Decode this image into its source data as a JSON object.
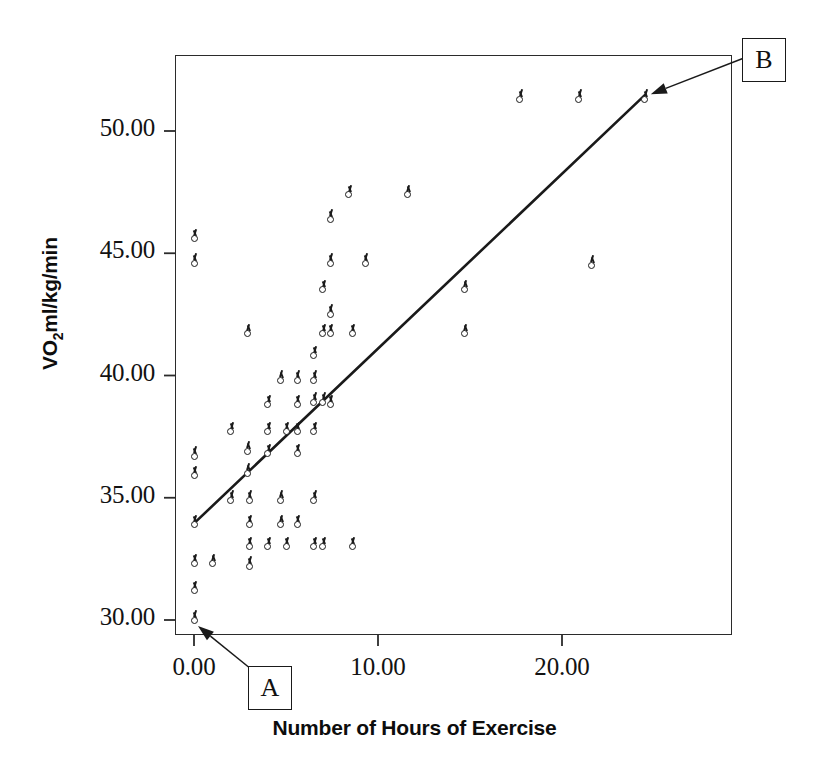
{
  "chart_data": {
    "type": "scatter",
    "title": "",
    "xlabel": "Number of Hours of Exercise",
    "ylabel": "VO2ml/kg/min",
    "ylabel_parts": {
      "pre": "VO",
      "sub": "2",
      "post": "ml/kg/min"
    },
    "xlim": [
      -0.9,
      29.8
    ],
    "ylim": [
      28.9,
      52.6
    ],
    "xticks": [
      0,
      10,
      20
    ],
    "xticklabels": [
      "0.00",
      "10.00",
      "20.00"
    ],
    "yticks": [
      30,
      35,
      40,
      45,
      50
    ],
    "yticklabels": [
      "30.00",
      "35.00",
      "40.00",
      "45.00",
      "50.00"
    ],
    "grid": false,
    "legend": false,
    "marker": "circle-with-tick",
    "marker_color": "#1b1b1b",
    "fit_line": {
      "type": "linear-regression",
      "intercept": 33.95,
      "slope": 0.715,
      "x_start": 0.0,
      "x_end": 24.5,
      "color": "#1a1a1a",
      "width": 2.6
    },
    "annotations": [
      {
        "label": "A",
        "target_point": {
          "x": 0.0,
          "y": 30.0
        },
        "description": "callout pointing to lowest-left data point"
      },
      {
        "label": "B",
        "target_point": {
          "x": 24.5,
          "y": 51.3
        },
        "description": "callout pointing to highest-right data point"
      }
    ],
    "points": [
      {
        "x": 0.0,
        "y": 45.6
      },
      {
        "x": 0.0,
        "y": 44.6
      },
      {
        "x": 0.0,
        "y": 36.7
      },
      {
        "x": 0.0,
        "y": 35.9
      },
      {
        "x": 0.0,
        "y": 33.9
      },
      {
        "x": 0.0,
        "y": 32.3
      },
      {
        "x": 0.0,
        "y": 31.2
      },
      {
        "x": 0.0,
        "y": 30.0
      },
      {
        "x": 1.0,
        "y": 32.3
      },
      {
        "x": 2.0,
        "y": 37.7
      },
      {
        "x": 2.0,
        "y": 34.9
      },
      {
        "x": 2.9,
        "y": 41.7
      },
      {
        "x": 2.9,
        "y": 36.9
      },
      {
        "x": 2.9,
        "y": 36.0
      },
      {
        "x": 3.0,
        "y": 34.9
      },
      {
        "x": 3.0,
        "y": 33.9
      },
      {
        "x": 3.0,
        "y": 33.0
      },
      {
        "x": 3.0,
        "y": 32.2
      },
      {
        "x": 4.0,
        "y": 38.8
      },
      {
        "x": 4.0,
        "y": 37.7
      },
      {
        "x": 4.0,
        "y": 36.8
      },
      {
        "x": 4.0,
        "y": 33.0
      },
      {
        "x": 4.7,
        "y": 39.8
      },
      {
        "x": 4.7,
        "y": 34.9
      },
      {
        "x": 4.7,
        "y": 33.9
      },
      {
        "x": 5.0,
        "y": 37.7
      },
      {
        "x": 5.0,
        "y": 33.0
      },
      {
        "x": 5.6,
        "y": 39.8
      },
      {
        "x": 5.6,
        "y": 38.8
      },
      {
        "x": 5.6,
        "y": 37.7
      },
      {
        "x": 5.6,
        "y": 36.8
      },
      {
        "x": 5.6,
        "y": 33.9
      },
      {
        "x": 6.5,
        "y": 40.8
      },
      {
        "x": 6.5,
        "y": 39.8
      },
      {
        "x": 6.5,
        "y": 38.9
      },
      {
        "x": 6.5,
        "y": 37.7
      },
      {
        "x": 6.5,
        "y": 34.9
      },
      {
        "x": 6.5,
        "y": 33.0
      },
      {
        "x": 7.0,
        "y": 43.5
      },
      {
        "x": 7.0,
        "y": 41.7
      },
      {
        "x": 7.0,
        "y": 38.9
      },
      {
        "x": 7.0,
        "y": 33.0
      },
      {
        "x": 7.4,
        "y": 46.4
      },
      {
        "x": 7.4,
        "y": 44.6
      },
      {
        "x": 7.4,
        "y": 42.5
      },
      {
        "x": 7.4,
        "y": 41.7
      },
      {
        "x": 7.4,
        "y": 38.8
      },
      {
        "x": 8.4,
        "y": 47.4
      },
      {
        "x": 8.6,
        "y": 41.7
      },
      {
        "x": 8.6,
        "y": 33.0
      },
      {
        "x": 9.3,
        "y": 44.6
      },
      {
        "x": 11.6,
        "y": 47.4
      },
      {
        "x": 14.7,
        "y": 43.5
      },
      {
        "x": 14.7,
        "y": 41.7
      },
      {
        "x": 17.7,
        "y": 51.3
      },
      {
        "x": 20.9,
        "y": 51.3
      },
      {
        "x": 21.6,
        "y": 44.5
      },
      {
        "x": 24.5,
        "y": 51.3
      }
    ]
  },
  "axis": {
    "x_title": "Number of Hours of Exercise",
    "y_title_pre": "VO",
    "y_title_sub": "2",
    "y_title_post": "ml/kg/min"
  },
  "callouts": {
    "a_label": "A",
    "b_label": "B"
  }
}
